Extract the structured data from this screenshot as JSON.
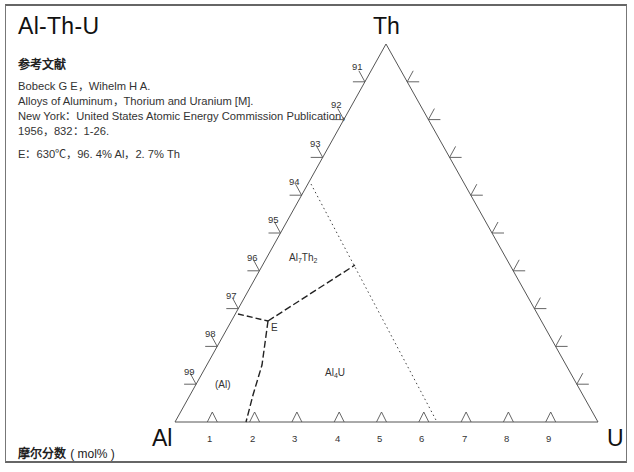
{
  "title": "Al-Th-U",
  "reference": {
    "heading": "参考文献",
    "lines": [
      "Bobeck G E，Wihelm H A.",
      "Alloys of Aluminum，Thorium and Uranium [M].",
      "New York：United States Atomic Energy Commission Publication，",
      "1956，832：1-26."
    ]
  },
  "eutectic_note": "E：630℃，96. 4% Al，2. 7% Th",
  "footer": {
    "label": "摩尔分数",
    "unit": "( mol% )"
  },
  "chart_data": {
    "type": "ternary-phase-diagram",
    "title": "Al-Th-U",
    "vertices": {
      "bottom_left": "Al",
      "top": "Th",
      "bottom_right": "U"
    },
    "axis_label": "摩尔分数 (mol%)",
    "left_edge_ticks": [
      "91",
      "92",
      "93",
      "94",
      "95",
      "96",
      "97",
      "98",
      "99"
    ],
    "bottom_edge_ticks": [
      "1",
      "2",
      "3",
      "4",
      "5",
      "6",
      "7",
      "8",
      "9"
    ],
    "right_edge_tick_count": 9,
    "phase_regions": [
      "(Al)",
      "Al7Th2",
      "Al4U"
    ],
    "invariant_point": {
      "label": "E",
      "temperature_C": 630,
      "Al_pct": 96.4,
      "Th_pct": 2.7
    },
    "lines": [
      {
        "style": "dashed",
        "from": "left edge near 97",
        "to": "E"
      },
      {
        "style": "dashed",
        "from": "E",
        "to": "bottom edge near 1.8"
      },
      {
        "style": "dashed",
        "from": "E",
        "to": "Al7Th2/Al4U boundary point"
      },
      {
        "style": "dotted",
        "from": "left edge near 94",
        "to": "bottom edge near 6.3"
      }
    ]
  },
  "diagram": {
    "vertex_labels": {
      "al": "Al",
      "th": "Th",
      "u": "U"
    },
    "phase_labels": {
      "al_ss": "(Al)",
      "al7th2_main": "Al",
      "al7th2_sub1": "7",
      "al7th2_mid": "Th",
      "al7th2_sub2": "2",
      "al4u_main": "Al",
      "al4u_sub": "4",
      "al4u_end": "U"
    },
    "eutectic_label": "E",
    "line_color": "#444444"
  }
}
